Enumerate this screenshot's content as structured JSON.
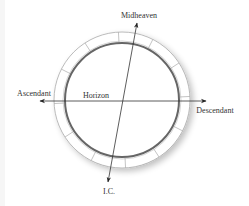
{
  "diagram": {
    "type": "astrological-chart-wheel",
    "labels": {
      "top": "Midheaven",
      "bottom": "I.C.",
      "left": "Ascendant",
      "right": "Descendant",
      "horizon": "Horizon"
    },
    "ring_segments": 12,
    "colors": {
      "line": "#333333",
      "inner_circle": "#666666",
      "ring_outline": "#aaaaaa",
      "shadow": "#dddddd"
    }
  }
}
